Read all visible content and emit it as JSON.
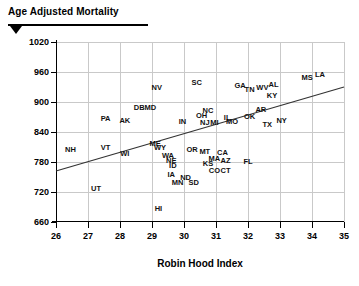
{
  "header": {
    "title": "Age Adjusted Mortality",
    "marker_icon": "triangle-down-icon"
  },
  "chart_data": {
    "type": "scatter",
    "title": "Age Adjusted Mortality",
    "xlabel": "Robin Hood Index",
    "ylabel": "Age Adjusted Mortality",
    "xlim": [
      26,
      35
    ],
    "ylim": [
      660,
      1020
    ],
    "xticks": [
      26,
      27,
      28,
      29,
      30,
      31,
      32,
      33,
      34,
      35
    ],
    "yticks": [
      660,
      720,
      780,
      840,
      900,
      960,
      1020
    ],
    "grid": true,
    "legend": "none",
    "point_style": "text-label",
    "trendline": {
      "label": "regression-line",
      "x": [
        26.0,
        35.0
      ],
      "y": [
        762,
        930
      ]
    },
    "points": [
      {
        "label": "NH",
        "x": 26.45,
        "y": 805
      },
      {
        "label": "UT",
        "x": 27.25,
        "y": 726
      },
      {
        "label": "PA",
        "x": 27.55,
        "y": 867
      },
      {
        "label": "VT",
        "x": 27.55,
        "y": 808
      },
      {
        "label": "AK",
        "x": 28.15,
        "y": 862
      },
      {
        "label": "WI",
        "x": 28.15,
        "y": 796
      },
      {
        "label": "DB",
        "x": 28.6,
        "y": 889
      },
      {
        "label": "MD",
        "x": 28.95,
        "y": 889
      },
      {
        "label": "NV",
        "x": 29.15,
        "y": 929
      },
      {
        "label": "ME",
        "x": 29.1,
        "y": 817
      },
      {
        "label": "WY",
        "x": 29.25,
        "y": 809
      },
      {
        "label": "HI",
        "x": 29.2,
        "y": 687
      },
      {
        "label": "WA",
        "x": 29.5,
        "y": 793
      },
      {
        "label": "NE",
        "x": 29.6,
        "y": 782
      },
      {
        "label": "IA",
        "x": 29.6,
        "y": 754
      },
      {
        "label": "ID",
        "x": 29.65,
        "y": 772
      },
      {
        "label": "MN",
        "x": 29.8,
        "y": 739
      },
      {
        "label": "IN",
        "x": 29.95,
        "y": 861
      },
      {
        "label": "ND",
        "x": 30.05,
        "y": 748
      },
      {
        "label": "SD",
        "x": 30.3,
        "y": 739
      },
      {
        "label": "OR",
        "x": 30.25,
        "y": 805
      },
      {
        "label": "MT",
        "x": 30.65,
        "y": 800
      },
      {
        "label": "KS",
        "x": 30.75,
        "y": 776
      },
      {
        "label": "SC",
        "x": 30.4,
        "y": 938
      },
      {
        "label": "OH",
        "x": 30.55,
        "y": 873
      },
      {
        "label": "NC",
        "x": 30.75,
        "y": 883
      },
      {
        "label": "NJ",
        "x": 30.65,
        "y": 858
      },
      {
        "label": "MI",
        "x": 30.95,
        "y": 858
      },
      {
        "label": "MA",
        "x": 30.95,
        "y": 787
      },
      {
        "label": "CO",
        "x": 30.95,
        "y": 763
      },
      {
        "label": "CT",
        "x": 31.3,
        "y": 763
      },
      {
        "label": "CA",
        "x": 31.2,
        "y": 799
      },
      {
        "label": "AZ",
        "x": 31.3,
        "y": 783
      },
      {
        "label": "IL",
        "x": 31.35,
        "y": 869
      },
      {
        "label": "MO",
        "x": 31.5,
        "y": 861
      },
      {
        "label": "GA",
        "x": 31.75,
        "y": 933
      },
      {
        "label": "TN",
        "x": 32.05,
        "y": 925
      },
      {
        "label": "OK",
        "x": 32.05,
        "y": 871
      },
      {
        "label": "FL",
        "x": 32.0,
        "y": 781
      },
      {
        "label": "WV",
        "x": 32.45,
        "y": 929
      },
      {
        "label": "AL",
        "x": 32.8,
        "y": 934
      },
      {
        "label": "AR",
        "x": 32.4,
        "y": 884
      },
      {
        "label": "KY",
        "x": 32.75,
        "y": 913
      },
      {
        "label": "TX",
        "x": 32.6,
        "y": 855
      },
      {
        "label": "NY",
        "x": 33.05,
        "y": 862
      },
      {
        "label": "MS",
        "x": 33.85,
        "y": 948
      },
      {
        "label": "LA",
        "x": 34.25,
        "y": 955
      }
    ]
  }
}
